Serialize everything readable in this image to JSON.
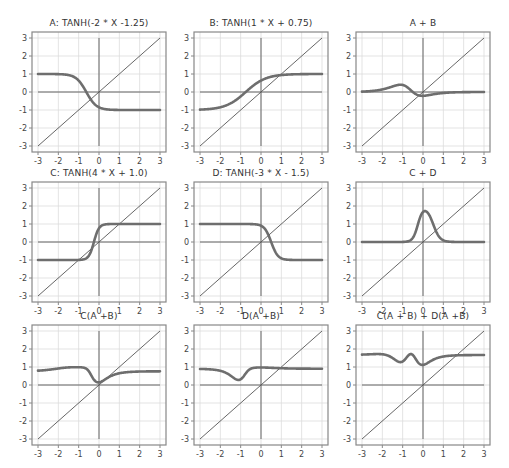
{
  "x_samples": [
    -3,
    -2.5,
    -2,
    -1.5,
    -1,
    -0.5,
    0,
    0.5,
    1,
    1.5,
    2,
    2.5,
    3
  ],
  "chart_data": [
    {
      "type": "line",
      "title": "A: TANH(-2 * X -1.25)",
      "xlim": [
        -3,
        3
      ],
      "ylim": [
        -3,
        3
      ],
      "xticks": [
        "-3",
        "-2",
        "-1",
        "0",
        "1",
        "2",
        "3"
      ],
      "yticks": [
        "-3",
        "-2",
        "-1",
        "0",
        "1",
        "2",
        "3"
      ],
      "grid": true,
      "series": [
        {
          "name": "A",
          "values": [
            1.0,
            1.0,
            0.997,
            0.96,
            0.65,
            -0.12,
            -0.85,
            -0.99,
            -1.0,
            -1.0,
            -1.0,
            -1.0,
            -1.0
          ]
        },
        {
          "name": "y=x",
          "values": [
            -3,
            -2.5,
            -2,
            -1.5,
            -1,
            -0.5,
            0,
            0.5,
            1,
            1.5,
            2,
            2.5,
            3
          ]
        }
      ]
    },
    {
      "type": "line",
      "title": "B: TANH(1 * X + 0.75)",
      "xlim": [
        -3,
        3
      ],
      "ylim": [
        -3,
        3
      ],
      "xticks": [
        "-3",
        "-2",
        "-1",
        "0",
        "1",
        "2",
        "3"
      ],
      "yticks": [
        "-3",
        "-2",
        "-1",
        "0",
        "1",
        "2",
        "3"
      ],
      "grid": true,
      "series": [
        {
          "name": "B",
          "values": [
            -0.98,
            -0.94,
            -0.85,
            -0.64,
            -0.24,
            0.24,
            0.64,
            0.85,
            0.94,
            0.98,
            0.99,
            1.0,
            1.0
          ]
        },
        {
          "name": "y=x",
          "values": [
            -3,
            -2.5,
            -2,
            -1.5,
            -1,
            -0.5,
            0,
            0.5,
            1,
            1.5,
            2,
            2.5,
            3
          ]
        }
      ]
    },
    {
      "type": "line",
      "title": "A + B",
      "xlim": [
        -3,
        3
      ],
      "ylim": [
        -3,
        3
      ],
      "xticks": [
        "-3",
        "-2",
        "-1",
        "0",
        "1",
        "2",
        "3"
      ],
      "yticks": [
        "-3",
        "-2",
        "-1",
        "0",
        "1",
        "2",
        "3"
      ],
      "grid": true,
      "series": [
        {
          "name": "A + B",
          "values": [
            0.02,
            0.06,
            0.15,
            0.32,
            0.41,
            0.12,
            -0.21,
            -0.14,
            -0.06,
            -0.02,
            -0.01,
            0.0,
            0.0
          ]
        },
        {
          "name": "y=x",
          "values": [
            -3,
            -2.5,
            -2,
            -1.5,
            -1,
            -0.5,
            0,
            0.5,
            1,
            1.5,
            2,
            2.5,
            3
          ]
        }
      ]
    },
    {
      "type": "line",
      "title": "C: TANH(4 * X + 1.0)",
      "xlim": [
        -3,
        3
      ],
      "ylim": [
        -3,
        3
      ],
      "xticks": [
        "-3",
        "-2",
        "-1",
        "0",
        "1",
        "2",
        "3"
      ],
      "yticks": [
        "-3",
        "-2",
        "-1",
        "0",
        "1",
        "2",
        "3"
      ],
      "grid": true,
      "series": [
        {
          "name": "C",
          "values": [
            -1.0,
            -1.0,
            -1.0,
            -1.0,
            -1.0,
            -0.76,
            0.76,
            1.0,
            1.0,
            1.0,
            1.0,
            1.0,
            1.0
          ]
        },
        {
          "name": "y=x",
          "values": [
            -3,
            -2.5,
            -2,
            -1.5,
            -1,
            -0.5,
            0,
            0.5,
            1,
            1.5,
            2,
            2.5,
            3
          ]
        }
      ]
    },
    {
      "type": "line",
      "title": "D: TANH(-3 * X - 1.5)",
      "xlim": [
        -3,
        3
      ],
      "ylim": [
        -3,
        3
      ],
      "xticks": [
        "-3",
        "-2",
        "-1",
        "0",
        "1",
        "2",
        "3"
      ],
      "yticks": [
        "-3",
        "-2",
        "-1",
        "0",
        "1",
        "2",
        "3"
      ],
      "grid": true,
      "series": [
        {
          "name": "D",
          "values": [
            1.0,
            1.0,
            1.0,
            1.0,
            1.0,
            0.995,
            0.91,
            0.0,
            -0.91,
            -0.995,
            -1.0,
            -1.0,
            -1.0
          ]
        },
        {
          "name": "y=x",
          "values": [
            -3,
            -2.5,
            -2,
            -1.5,
            -1,
            -0.5,
            0,
            0.5,
            1,
            1.5,
            2,
            2.5,
            3
          ]
        }
      ]
    },
    {
      "type": "line",
      "title": "C + D",
      "xlim": [
        -3,
        3
      ],
      "ylim": [
        -3,
        3
      ],
      "xticks": [
        "-3",
        "-2",
        "-1",
        "0",
        "1",
        "2",
        "3"
      ],
      "yticks": [
        "-3",
        "-2",
        "-1",
        "0",
        "1",
        "2",
        "3"
      ],
      "grid": true,
      "series": [
        {
          "name": "C + D",
          "values": [
            0.0,
            0.0,
            0.0,
            0.0,
            0.0,
            0.24,
            1.67,
            1.0,
            0.09,
            0.005,
            0.0,
            0.0,
            0.0
          ]
        },
        {
          "name": "y=x",
          "values": [
            -3,
            -2.5,
            -2,
            -1.5,
            -1,
            -0.5,
            0,
            0.5,
            1,
            1.5,
            2,
            2.5,
            3
          ]
        }
      ]
    },
    {
      "type": "line",
      "title": "C(A +B)",
      "xlim": [
        -3,
        3
      ],
      "ylim": [
        -3,
        3
      ],
      "xticks": [
        "-3",
        "-2",
        "-1",
        "0",
        "1",
        "2",
        "3"
      ],
      "yticks": [
        "-3",
        "-2",
        "-1",
        "0",
        "1",
        "2",
        "3"
      ],
      "grid": true,
      "series": [
        {
          "name": "C(A+B)",
          "values": [
            0.81,
            0.86,
            0.92,
            0.98,
            0.99,
            0.9,
            0.16,
            0.41,
            0.66,
            0.73,
            0.75,
            0.76,
            0.76
          ]
        },
        {
          "name": "y=x",
          "values": [
            -3,
            -2.5,
            -2,
            -1.5,
            -1,
            -0.5,
            0,
            0.5,
            1,
            1.5,
            2,
            2.5,
            3
          ]
        }
      ]
    },
    {
      "type": "line",
      "title": "D(A +B)",
      "xlim": [
        -3,
        3
      ],
      "ylim": [
        -3,
        3
      ],
      "xticks": [
        "-3",
        "-2",
        "-1",
        "0",
        "1",
        "2",
        "3"
      ],
      "yticks": [
        "-3",
        "-2",
        "-1",
        "0",
        "1",
        "2",
        "3"
      ],
      "grid": true,
      "series": [
        {
          "name": "D(A+B)",
          "values": [
            0.89,
            0.87,
            0.81,
            0.55,
            0.35,
            0.82,
            0.98,
            0.96,
            0.93,
            0.91,
            0.91,
            0.91,
            0.91
          ]
        },
        {
          "name": "y=x",
          "values": [
            -3,
            -2.5,
            -2,
            -1.5,
            -1,
            -0.5,
            0,
            0.5,
            1,
            1.5,
            2,
            2.5,
            3
          ]
        }
      ]
    },
    {
      "type": "line",
      "title": "C(A + B) + D(A +B)",
      "xlim": [
        -3,
        3
      ],
      "ylim": [
        -3,
        3
      ],
      "xticks": [
        "-3",
        "-2",
        "-1",
        "0",
        "1",
        "2",
        "3"
      ],
      "yticks": [
        "-3",
        "-2",
        "-1",
        "0",
        "1",
        "2",
        "3"
      ],
      "grid": true,
      "series": [
        {
          "name": "C(A+B)+D(A+B)",
          "values": [
            1.7,
            1.73,
            1.73,
            1.53,
            1.34,
            1.72,
            1.14,
            1.37,
            1.59,
            1.64,
            1.66,
            1.67,
            1.67
          ]
        },
        {
          "name": "y=x",
          "values": [
            -3,
            -2.5,
            -2,
            -1.5,
            -1,
            -0.5,
            0,
            0.5,
            1,
            1.5,
            2,
            2.5,
            3
          ]
        }
      ]
    }
  ],
  "style": {
    "curve_color": "#6e6e6e",
    "line_color": "#555555",
    "grid_color": "#dcdcdc",
    "axis_color": "#666666",
    "frame_color": "#888888"
  }
}
